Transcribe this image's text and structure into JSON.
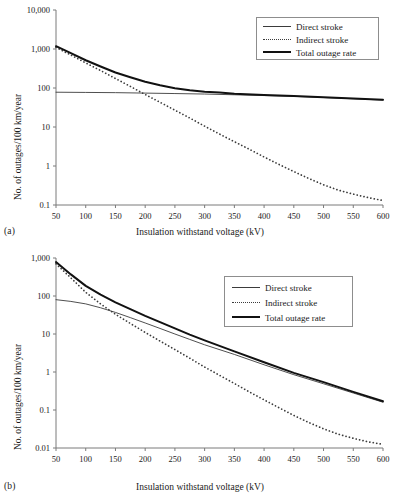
{
  "figure": {
    "panel_a_label": "(a)",
    "panel_b_label": "(b)"
  },
  "chart_data": [
    {
      "id": "a",
      "type": "line",
      "title": "",
      "xlabel": "Insulation withstand voltage (kV)",
      "ylabel": "No. of outages/100 km/year",
      "xlim": [
        50,
        600
      ],
      "ylim": [
        0.1,
        10000
      ],
      "yscale": "log",
      "xscale": "linear",
      "grid": false,
      "xticks": [
        50,
        100,
        150,
        200,
        250,
        300,
        350,
        400,
        450,
        500,
        550,
        600
      ],
      "xticklabels": [
        "50",
        "100",
        "150",
        "200",
        "250",
        "300",
        "350",
        "400",
        "450",
        "500",
        "550",
        "600"
      ],
      "yticks": [
        0.1,
        1,
        10,
        100,
        1000,
        10000
      ],
      "yticklabels": [
        "0.1",
        "1",
        "10",
        "100",
        "1,000",
        "10,000"
      ],
      "legend_position": "upper right",
      "series": [
        {
          "name": "Direct stroke",
          "style": "solid-thin",
          "color": "#3b3b3b",
          "x": [
            50,
            100,
            150,
            200,
            250,
            300,
            350,
            400,
            450,
            500,
            550,
            600
          ],
          "values": [
            78,
            77,
            76,
            74,
            72,
            70,
            67,
            64,
            61,
            57,
            53,
            49
          ]
        },
        {
          "name": "Indirect stroke",
          "style": "dotted",
          "color": "#3b3b3b",
          "x": [
            50,
            75,
            100,
            125,
            150,
            175,
            200,
            225,
            250,
            275,
            300,
            325,
            350,
            375,
            400,
            425,
            450,
            475,
            500,
            525,
            550,
            575,
            600
          ],
          "values": [
            1100,
            700,
            440,
            280,
            175,
            110,
            68,
            43,
            27,
            17,
            10.5,
            6.6,
            4.2,
            2.7,
            1.7,
            1.1,
            0.72,
            0.48,
            0.33,
            0.24,
            0.19,
            0.155,
            0.13
          ]
        },
        {
          "name": "Total outage rate",
          "style": "solid-thick",
          "color": "#111111",
          "x": [
            50,
            75,
            100,
            125,
            150,
            175,
            200,
            225,
            250,
            275,
            300,
            325,
            350,
            400,
            450,
            500,
            550,
            600
          ],
          "values": [
            1180,
            780,
            515,
            355,
            250,
            188,
            144,
            117,
            99,
            87,
            80.5,
            76.2,
            71.5,
            66,
            62,
            58,
            53.5,
            50
          ]
        }
      ]
    },
    {
      "id": "b",
      "type": "line",
      "title": "",
      "xlabel": "Insulation withstand voltage (kV)",
      "ylabel": "No. of outages/100 km/year",
      "xlim": [
        50,
        600
      ],
      "ylim": [
        0.01,
        1000
      ],
      "yscale": "log",
      "xscale": "linear",
      "grid": false,
      "xticks": [
        50,
        100,
        150,
        200,
        250,
        300,
        350,
        400,
        450,
        500,
        550,
        600
      ],
      "xticklabels": [
        "50",
        "100",
        "150",
        "200",
        "250",
        "300",
        "350",
        "400",
        "450",
        "500",
        "550",
        "600"
      ],
      "yticks": [
        0.01,
        0.1,
        1,
        10,
        100,
        1000
      ],
      "yticklabels": [
        "0.01",
        "0.1",
        "1",
        "10",
        "100",
        "1,000"
      ],
      "legend_position": "upper right",
      "series": [
        {
          "name": "Direct stroke",
          "style": "solid-thin",
          "color": "#3b3b3b",
          "x": [
            50,
            75,
            100,
            125,
            150,
            175,
            200,
            225,
            250,
            275,
            300,
            350,
            400,
            450,
            500,
            550,
            600
          ],
          "values": [
            80,
            72,
            62,
            49,
            37,
            27,
            19.5,
            14,
            10,
            7.2,
            5.2,
            2.9,
            1.55,
            0.85,
            0.49,
            0.28,
            0.16
          ]
        },
        {
          "name": "Indirect stroke",
          "style": "dotted",
          "color": "#3b3b3b",
          "x": [
            50,
            75,
            100,
            125,
            150,
            175,
            200,
            225,
            250,
            275,
            300,
            325,
            350,
            375,
            400,
            425,
            450,
            475,
            500,
            525,
            550,
            575,
            600
          ],
          "values": [
            700,
            300,
            125,
            62,
            33,
            19,
            11,
            6.5,
            3.9,
            2.3,
            1.35,
            0.82,
            0.5,
            0.3,
            0.185,
            0.115,
            0.072,
            0.047,
            0.032,
            0.023,
            0.018,
            0.0145,
            0.0125
          ]
        },
        {
          "name": "Total outage rate",
          "style": "solid-thick",
          "color": "#111111",
          "x": [
            50,
            75,
            100,
            125,
            150,
            175,
            200,
            225,
            250,
            275,
            300,
            350,
            400,
            450,
            500,
            550,
            600
          ],
          "values": [
            780,
            370,
            185,
            108,
            68,
            45,
            30,
            20.5,
            14,
            9.6,
            6.8,
            3.5,
            1.8,
            0.95,
            0.54,
            0.3,
            0.17
          ]
        }
      ]
    }
  ],
  "legend": {
    "entries": [
      {
        "label": "Direct stroke",
        "style": "solid-thin"
      },
      {
        "label": "Indirect stroke",
        "style": "dotted"
      },
      {
        "label": "Total outage rate",
        "style": "solid-thick"
      }
    ]
  }
}
